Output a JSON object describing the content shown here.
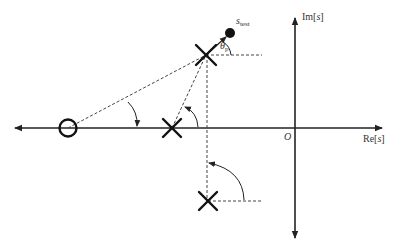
{
  "figure": {
    "colors": {
      "axis": "#222222",
      "dashed": "#444444",
      "marker": "#111111",
      "text": "#333333",
      "background": "#ffffff"
    }
  },
  "axes": {
    "real_label_prefix": "Re[",
    "real_label_var": "s",
    "real_label_suffix": "]",
    "imag_label_prefix": "Im[",
    "imag_label_var": "s",
    "imag_label_suffix": "]",
    "origin_label": "O"
  },
  "points": {
    "test_point_label": "s",
    "test_point_subscript": "test",
    "angle_label": "θ",
    "angle_subscript": "p"
  },
  "markers": {
    "zeros": [
      {
        "name": "zero-real",
        "symbol": "O"
      }
    ],
    "poles": [
      {
        "name": "pole-upper-complex",
        "symbol": "X"
      },
      {
        "name": "pole-real",
        "symbol": "X"
      },
      {
        "name": "pole-lower-complex",
        "symbol": "X"
      }
    ]
  }
}
